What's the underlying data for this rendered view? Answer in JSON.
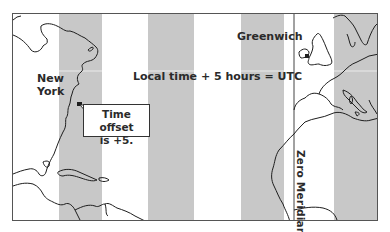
{
  "map": {
    "type": "time-zone illustration",
    "frame": {
      "left": 12,
      "top": 13,
      "width": 366,
      "height": 208,
      "border_color": "#555555"
    },
    "band_color": "#c8c8c8",
    "bands": [
      {
        "left": 46,
        "width": 43
      },
      {
        "left": 135,
        "width": 46
      },
      {
        "left": 228,
        "width": 43
      },
      {
        "left": 321,
        "width": 45
      }
    ],
    "zero_meridian_x": 281
  },
  "labels": {
    "new_york_line1": "New",
    "new_york_line2": "York",
    "greenwich": "Greenwich",
    "utc_formula": "Local time + 5 hours = UTC",
    "callout_line1": "Time offset",
    "callout_line2": "is +5.",
    "zero_meridian": "Zero Meridian"
  },
  "markers": [
    {
      "name": "new-york",
      "x": 67,
      "y": 90
    },
    {
      "name": "greenwich",
      "x": 294,
      "y": 43
    }
  ]
}
